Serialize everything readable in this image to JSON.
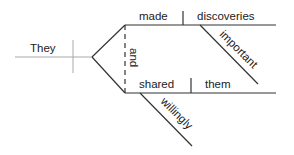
{
  "diagram": {
    "type": "sentence-diagram",
    "subject": "They",
    "conjunction": "and",
    "predicates": [
      {
        "verb": "made",
        "object": "discoveries",
        "object_modifier": "important"
      },
      {
        "verb": "shared",
        "object": "them",
        "verb_modifier": "willingly"
      }
    ]
  },
  "colors": {
    "line": "#333333",
    "subject_line": "#999999",
    "text": "#222222"
  }
}
